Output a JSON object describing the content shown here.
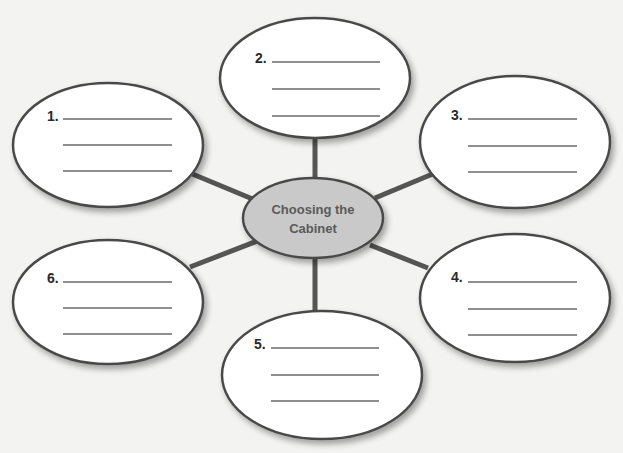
{
  "diagram": {
    "type": "concept-web",
    "center": {
      "line1": "Choosing the",
      "line2": "Cabinet",
      "fill": "#c9c9c9",
      "text_color": "#5a5a5a"
    },
    "nodes": [
      {
        "label": "1.",
        "blank_lines": 3
      },
      {
        "label": "2.",
        "blank_lines": 3
      },
      {
        "label": "3.",
        "blank_lines": 3
      },
      {
        "label": "4.",
        "blank_lines": 3
      },
      {
        "label": "5.",
        "blank_lines": 3
      },
      {
        "label": "6.",
        "blank_lines": 3
      }
    ],
    "colors": {
      "background": "#f3f3f2",
      "node_fill": "#ffffff",
      "outline": "#4a4a4a",
      "connector": "#555555",
      "blank_line": "#6a6a6a"
    }
  }
}
